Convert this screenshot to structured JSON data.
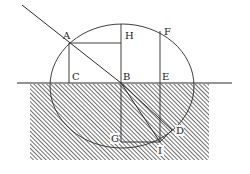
{
  "diagram": {
    "type": "refraction-construction",
    "colors": {
      "line": "#2a2a2a",
      "hatch": "#555555",
      "background": "#ffffff"
    },
    "points": {
      "A": {
        "label": "A",
        "x": 69,
        "y": 43
      },
      "B": {
        "label": "B",
        "x": 121,
        "y": 83
      },
      "C": {
        "label": "C",
        "x": 69,
        "y": 83
      },
      "H": {
        "label": "H",
        "x": 121,
        "y": 43
      },
      "F": {
        "label": "F",
        "x": 160,
        "y": 31
      },
      "E": {
        "label": "E",
        "x": 160,
        "y": 83
      },
      "G": {
        "label": "G",
        "x": 121,
        "y": 142
      },
      "I": {
        "label": "I",
        "x": 160,
        "y": 142
      },
      "D": {
        "label": "D",
        "x": 174,
        "y": 130
      }
    },
    "labels": {
      "A": "A",
      "B": "B",
      "C": "C",
      "D": "D",
      "E": "E",
      "F": "F",
      "G": "G",
      "H": "H",
      "I": "I"
    }
  }
}
